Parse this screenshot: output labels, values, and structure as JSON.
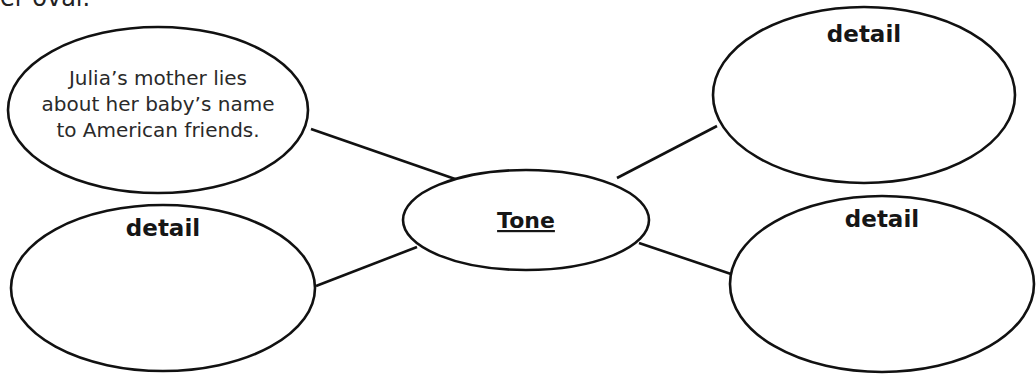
{
  "header_fragment": "er oval.",
  "center": {
    "label": "Tone"
  },
  "nodes": [
    {
      "id": "top-left",
      "lines": [
        "Julia’s mother lies",
        "about her baby’s name",
        "to American friends."
      ]
    },
    {
      "id": "bottom-left",
      "label": "detail"
    },
    {
      "id": "top-right",
      "label": "detail"
    },
    {
      "id": "bottom-right",
      "label": "detail"
    }
  ],
  "colors": {
    "stroke": "#111111",
    "fill": "#ffffff",
    "text": "#161616"
  }
}
